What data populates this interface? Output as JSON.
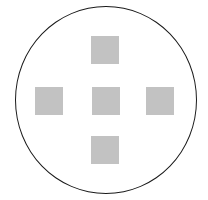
{
  "diagram": {
    "outline": {
      "shape": "circle",
      "stroke": "#1a1a1a",
      "left": 15,
      "top": 6,
      "width": 182,
      "height": 188
    },
    "squares": [
      {
        "name": "top",
        "left": 91,
        "top": 36,
        "size": 28,
        "color": "#c2c2c2"
      },
      {
        "name": "left",
        "left": 35,
        "top": 87,
        "size": 28,
        "color": "#c2c2c2"
      },
      {
        "name": "center",
        "left": 92,
        "top": 87,
        "size": 28,
        "color": "#c2c2c2"
      },
      {
        "name": "right",
        "left": 146,
        "top": 87,
        "size": 28,
        "color": "#c2c2c2"
      },
      {
        "name": "bottom",
        "left": 91,
        "top": 136,
        "size": 28,
        "color": "#c2c2c2"
      }
    ]
  }
}
